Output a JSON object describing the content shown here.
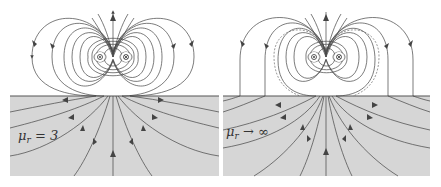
{
  "figure": {
    "colors": {
      "background": "#ffffff",
      "material": "#d6d6d6",
      "field_line": "#444444",
      "surface": "#555555"
    },
    "panels": [
      {
        "id": "left",
        "label_symbol": "μ",
        "label_sub": "r",
        "label_rel": " = 3",
        "material_permeability": "3",
        "sources": [
          {
            "type": "current-out",
            "glyph": "⊙"
          },
          {
            "type": "current-in",
            "glyph": "⊗"
          }
        ]
      },
      {
        "id": "right",
        "label_symbol": "μ",
        "label_sub": "r",
        "label_rel": " → ∞",
        "material_permeability": "∞",
        "dashed_reference_lines": true,
        "sources": [
          {
            "type": "current-out",
            "glyph": "⊙"
          },
          {
            "type": "current-in",
            "glyph": "⊗"
          }
        ]
      }
    ]
  }
}
